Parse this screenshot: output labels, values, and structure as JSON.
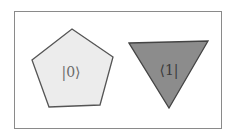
{
  "diagram": {
    "shapes": [
      {
        "shape": "pentagon",
        "label": "|0⟩",
        "fill": "#ececec",
        "stroke": "#555555"
      },
      {
        "shape": "inverted-triangle",
        "label": "⟨1|",
        "fill": "#8c8c8c",
        "stroke": "#444444"
      }
    ],
    "frame_color": "#8a8a8a"
  }
}
